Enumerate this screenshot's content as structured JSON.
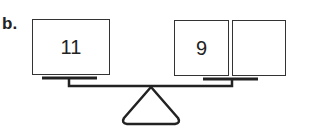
{
  "problem_label": "b.",
  "left_pan": {
    "boxes": [
      {
        "value": "11"
      }
    ]
  },
  "right_pan": {
    "boxes": [
      {
        "value": "9"
      },
      {
        "value": ""
      }
    ]
  }
}
